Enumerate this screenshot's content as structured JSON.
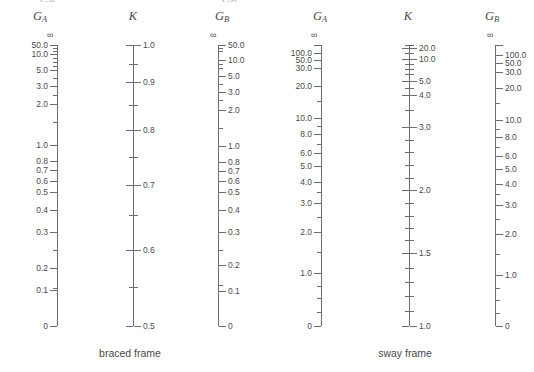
{
  "figure": {
    "type": "nomograph",
    "width": 534,
    "height": 372,
    "line_color": "#6e6e6e",
    "text_color": "#4a4a4a",
    "background": "#ffffff",
    "top_clipped_row": [
      {
        "text": "G",
        "sub": "A",
        "x": 40
      },
      {
        "text": "G",
        "sub": "B",
        "x": 222
      }
    ]
  },
  "charts": [
    {
      "id": "braced-frame",
      "caption": "braced frame",
      "caption_x": 130,
      "caption_y": 347,
      "scales": [
        {
          "id": "braced-ga",
          "title": "G",
          "title_sub": "A",
          "title_x": 40,
          "axis_x": 57,
          "axis_top": 45,
          "axis_bottom": 326,
          "tick_side": "left",
          "label_side": "left",
          "infinity_label": "∞",
          "infinity_x": 47,
          "infinity_y": 30,
          "ticks": [
            {
              "y": 45,
              "major": true,
              "label": "50.0"
            },
            {
              "y": 48,
              "major": false,
              "label": ""
            },
            {
              "y": 51,
              "major": false,
              "label": ""
            },
            {
              "y": 54,
              "major": true,
              "label": "10.0"
            },
            {
              "y": 58,
              "major": false,
              "label": ""
            },
            {
              "y": 62,
              "major": false,
              "label": ""
            },
            {
              "y": 66,
              "major": false,
              "label": ""
            },
            {
              "y": 70,
              "major": true,
              "label": "5.0"
            },
            {
              "y": 78,
              "major": false,
              "label": ""
            },
            {
              "y": 86,
              "major": true,
              "label": "3.0"
            },
            {
              "y": 95,
              "major": false,
              "label": ""
            },
            {
              "y": 104,
              "major": true,
              "label": "2.0"
            },
            {
              "y": 122,
              "major": false,
              "label": ""
            },
            {
              "y": 145,
              "major": true,
              "label": "1.0"
            },
            {
              "y": 161,
              "major": true,
              "label": "0.8"
            },
            {
              "y": 170,
              "major": true,
              "label": "0.7"
            },
            {
              "y": 181,
              "major": true,
              "label": "0.6"
            },
            {
              "y": 192,
              "major": true,
              "label": "0.5"
            },
            {
              "y": 210,
              "major": true,
              "label": "0.4"
            },
            {
              "y": 232,
              "major": true,
              "label": "0.3"
            },
            {
              "y": 250,
              "major": false,
              "label": ""
            },
            {
              "y": 268,
              "major": true,
              "label": "0.2"
            },
            {
              "y": 288,
              "major": false,
              "label": ""
            },
            {
              "y": 288,
              "major": false,
              "label": ""
            },
            {
              "y": 290,
              "major": true,
              "label": "0.1"
            },
            {
              "y": 326,
              "major": true,
              "label": "0"
            }
          ]
        },
        {
          "id": "braced-k",
          "title": "K",
          "title_sub": "",
          "title_x": 133,
          "axis_x": 133,
          "axis_top": 45,
          "axis_bottom": 326,
          "tick_side": "both",
          "label_side": "right",
          "infinity_label": "",
          "ticks": [
            {
              "y": 45,
              "major": true,
              "label": "1.0"
            },
            {
              "y": 64,
              "major": false,
              "label": ""
            },
            {
              "y": 82,
              "major": true,
              "label": "0.9"
            },
            {
              "y": 105,
              "major": false,
              "label": ""
            },
            {
              "y": 130,
              "major": true,
              "label": "0.8"
            },
            {
              "y": 157,
              "major": false,
              "label": ""
            },
            {
              "y": 185,
              "major": true,
              "label": "0.7"
            },
            {
              "y": 215,
              "major": false,
              "label": ""
            },
            {
              "y": 250,
              "major": true,
              "label": "0.6"
            },
            {
              "y": 287,
              "major": false,
              "label": ""
            },
            {
              "y": 326,
              "major": true,
              "label": "0.5"
            }
          ]
        },
        {
          "id": "braced-gb",
          "title": "G",
          "title_sub": "B",
          "title_x": 222,
          "axis_x": 218,
          "axis_top": 45,
          "axis_bottom": 326,
          "tick_side": "right",
          "label_side": "right",
          "infinity_label": "∞",
          "infinity_x": 210,
          "infinity_y": 30,
          "ticks": [
            {
              "y": 45,
              "major": true,
              "label": "50.0"
            },
            {
              "y": 48,
              "major": false,
              "label": ""
            },
            {
              "y": 51,
              "major": false,
              "label": ""
            },
            {
              "y": 60,
              "major": true,
              "label": "10.0"
            },
            {
              "y": 64,
              "major": false,
              "label": ""
            },
            {
              "y": 68,
              "major": false,
              "label": ""
            },
            {
              "y": 76,
              "major": true,
              "label": "5.0"
            },
            {
              "y": 84,
              "major": false,
              "label": ""
            },
            {
              "y": 92,
              "major": true,
              "label": "3.0"
            },
            {
              "y": 100,
              "major": false,
              "label": ""
            },
            {
              "y": 110,
              "major": true,
              "label": "2.0"
            },
            {
              "y": 128,
              "major": false,
              "label": ""
            },
            {
              "y": 146,
              "major": true,
              "label": "1.0"
            },
            {
              "y": 162,
              "major": true,
              "label": "0.8"
            },
            {
              "y": 171,
              "major": true,
              "label": "0.7"
            },
            {
              "y": 181,
              "major": true,
              "label": "0.6"
            },
            {
              "y": 192,
              "major": true,
              "label": "0.5"
            },
            {
              "y": 210,
              "major": true,
              "label": "0.4"
            },
            {
              "y": 232,
              "major": true,
              "label": "0.3"
            },
            {
              "y": 250,
              "major": false,
              "label": ""
            },
            {
              "y": 265,
              "major": true,
              "label": "0.2"
            },
            {
              "y": 285,
              "major": false,
              "label": ""
            },
            {
              "y": 291,
              "major": true,
              "label": "0.1"
            },
            {
              "y": 326,
              "major": true,
              "label": "0"
            }
          ]
        }
      ]
    },
    {
      "id": "sway-frame",
      "caption": "sway frame",
      "caption_x": 405,
      "caption_y": 347,
      "scales": [
        {
          "id": "sway-ga",
          "title": "G",
          "title_sub": "A",
          "title_x": 320,
          "axis_x": 321,
          "axis_top": 45,
          "axis_bottom": 326,
          "tick_side": "left",
          "label_side": "left",
          "infinity_label": "∞",
          "infinity_x": 311,
          "infinity_y": 30,
          "ticks": [
            {
              "y": 45,
              "major": true,
              "label": ""
            },
            {
              "y": 53,
              "major": true,
              "label": "100.0"
            },
            {
              "y": 60,
              "major": true,
              "label": "50.0"
            },
            {
              "y": 68,
              "major": true,
              "label": "30.0"
            },
            {
              "y": 86,
              "major": true,
              "label": "20.0"
            },
            {
              "y": 101,
              "major": false,
              "label": ""
            },
            {
              "y": 118,
              "major": true,
              "label": "10.0"
            },
            {
              "y": 126,
              "major": false,
              "label": ""
            },
            {
              "y": 134,
              "major": true,
              "label": "8.0"
            },
            {
              "y": 144,
              "major": false,
              "label": ""
            },
            {
              "y": 153,
              "major": true,
              "label": "6.0"
            },
            {
              "y": 166,
              "major": true,
              "label": "5.0"
            },
            {
              "y": 182,
              "major": true,
              "label": "4.0"
            },
            {
              "y": 192,
              "major": false,
              "label": ""
            },
            {
              "y": 203,
              "major": true,
              "label": "3.0"
            },
            {
              "y": 217,
              "major": false,
              "label": ""
            },
            {
              "y": 232,
              "major": true,
              "label": "2.0"
            },
            {
              "y": 252,
              "major": false,
              "label": ""
            },
            {
              "y": 273,
              "major": true,
              "label": "1.0"
            },
            {
              "y": 286,
              "major": false,
              "label": ""
            },
            {
              "y": 298,
              "major": false,
              "label": ""
            },
            {
              "y": 312,
              "major": false,
              "label": ""
            },
            {
              "y": 326,
              "major": true,
              "label": "0"
            }
          ]
        },
        {
          "id": "sway-k",
          "title": "K",
          "title_sub": "",
          "title_x": 408,
          "axis_x": 409,
          "axis_top": 45,
          "axis_bottom": 326,
          "tick_side": "both",
          "label_side": "right",
          "infinity_label": "",
          "ticks": [
            {
              "y": 45,
              "major": false,
              "label": ""
            },
            {
              "y": 48,
              "major": true,
              "label": "20.0"
            },
            {
              "y": 53,
              "major": false,
              "label": ""
            },
            {
              "y": 59,
              "major": true,
              "label": "10.0"
            },
            {
              "y": 64,
              "major": false,
              "label": ""
            },
            {
              "y": 69,
              "major": false,
              "label": ""
            },
            {
              "y": 74,
              "major": false,
              "label": ""
            },
            {
              "y": 81,
              "major": true,
              "label": "5.0"
            },
            {
              "y": 88,
              "major": false,
              "label": ""
            },
            {
              "y": 95,
              "major": true,
              "label": "4.0"
            },
            {
              "y": 110,
              "major": false,
              "label": ""
            },
            {
              "y": 127,
              "major": true,
              "label": "3.0"
            },
            {
              "y": 140,
              "major": false,
              "label": ""
            },
            {
              "y": 152,
              "major": false,
              "label": ""
            },
            {
              "y": 165,
              "major": false,
              "label": ""
            },
            {
              "y": 178,
              "major": false,
              "label": ""
            },
            {
              "y": 190,
              "major": true,
              "label": "2.0"
            },
            {
              "y": 203,
              "major": false,
              "label": ""
            },
            {
              "y": 216,
              "major": false,
              "label": ""
            },
            {
              "y": 228,
              "major": false,
              "label": ""
            },
            {
              "y": 240,
              "major": false,
              "label": ""
            },
            {
              "y": 253,
              "major": true,
              "label": "1.5"
            },
            {
              "y": 268,
              "major": false,
              "label": ""
            },
            {
              "y": 282,
              "major": false,
              "label": ""
            },
            {
              "y": 296,
              "major": false,
              "label": ""
            },
            {
              "y": 311,
              "major": false,
              "label": ""
            },
            {
              "y": 326,
              "major": true,
              "label": "1.0"
            }
          ]
        },
        {
          "id": "sway-gb",
          "title": "G",
          "title_sub": "B",
          "title_x": 492,
          "axis_x": 495,
          "axis_top": 45,
          "axis_bottom": 326,
          "tick_side": "right",
          "label_side": "right",
          "infinity_label": "∞",
          "infinity_x": 487,
          "infinity_y": 30,
          "ticks": [
            {
              "y": 45,
              "major": true,
              "label": ""
            },
            {
              "y": 55,
              "major": true,
              "label": "100.0"
            },
            {
              "y": 63,
              "major": true,
              "label": "50.0"
            },
            {
              "y": 72,
              "major": true,
              "label": "30.0"
            },
            {
              "y": 88,
              "major": true,
              "label": "20.0"
            },
            {
              "y": 103,
              "major": false,
              "label": ""
            },
            {
              "y": 120,
              "major": true,
              "label": "10.0"
            },
            {
              "y": 129,
              "major": false,
              "label": ""
            },
            {
              "y": 137,
              "major": true,
              "label": "8.0"
            },
            {
              "y": 147,
              "major": false,
              "label": ""
            },
            {
              "y": 156,
              "major": true,
              "label": "6.0"
            },
            {
              "y": 169,
              "major": true,
              "label": "5.0"
            },
            {
              "y": 184,
              "major": true,
              "label": "4.0"
            },
            {
              "y": 194,
              "major": false,
              "label": ""
            },
            {
              "y": 205,
              "major": true,
              "label": "3.0"
            },
            {
              "y": 219,
              "major": false,
              "label": ""
            },
            {
              "y": 234,
              "major": true,
              "label": "2.0"
            },
            {
              "y": 254,
              "major": false,
              "label": ""
            },
            {
              "y": 275,
              "major": true,
              "label": "1.0"
            },
            {
              "y": 288,
              "major": false,
              "label": ""
            },
            {
              "y": 300,
              "major": false,
              "label": ""
            },
            {
              "y": 313,
              "major": false,
              "label": ""
            },
            {
              "y": 326,
              "major": true,
              "label": "0"
            }
          ]
        }
      ]
    }
  ]
}
